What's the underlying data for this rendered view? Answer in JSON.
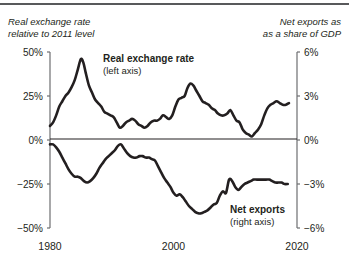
{
  "figure": {
    "header_left": "Real exchange rate\nrelative to 2011 level",
    "header_right": "Net exports as\nas a share of GDP",
    "label_upper_title": "Real exchange rate",
    "label_upper_sub": "(left axis)",
    "label_lower_title": "Net exports",
    "label_lower_sub": "(right axis)",
    "line_color": "#231f20",
    "axis_color": "#6d6e71",
    "background": "#ffffff"
  },
  "chart_data": {
    "type": "line",
    "title": "",
    "subtitle": "",
    "xlabel": "",
    "ylabel": "Real exchange rate relative to 2011 level",
    "y2label": "Net exports as as a share of GDP",
    "grid": false,
    "legend": "inline-annotations",
    "xlim": [
      1980,
      2020
    ],
    "xticks": [
      1980,
      2000,
      2020
    ],
    "xticklabels": [
      "1980",
      "2000",
      "2020"
    ],
    "ylim": [
      -50,
      50
    ],
    "yticks": [
      50,
      25,
      0,
      -25,
      -50
    ],
    "yticklabels": [
      "50%",
      "25%",
      "0%",
      "-25%",
      "-50%"
    ],
    "y2lim": [
      -6,
      6
    ],
    "y2ticks": [
      6,
      3,
      0,
      -3,
      -6
    ],
    "y2ticklabels": [
      "6%",
      "3%",
      "0%",
      "-3%",
      "-6%"
    ],
    "series": [
      {
        "name": "Real exchange rate",
        "axis": "left",
        "unit": "percent",
        "x": [
          1980,
          1980.5,
          1981,
          1981.5,
          1982,
          1982.5,
          1983,
          1983.5,
          1984,
          1984.5,
          1985,
          1985.4,
          1985.8,
          1986.3,
          1986.8,
          1987.3,
          1987.8,
          1988.3,
          1988.8,
          1989.3,
          1989.8,
          1990.3,
          1990.8,
          1991.3,
          1991.8,
          1992.3,
          1992.8,
          1993.3,
          1993.8,
          1994.3,
          1994.8,
          1995.3,
          1995.8,
          1996.3,
          1996.8,
          1997.3,
          1997.8,
          1998.3,
          1998.8,
          1999.3,
          1999.8,
          2000.3,
          2000.8,
          2001.3,
          2001.8,
          2002.2,
          2002.7,
          2003.2,
          2003.7,
          2004.2,
          2004.7,
          2005.2,
          2005.7,
          2006.2,
          2006.7,
          2007.2,
          2007.7,
          2008.2,
          2008.7,
          2009.2,
          2009.7,
          2010.2,
          2010.7,
          2011.2,
          2011.7,
          2012.2,
          2012.7,
          2013.2,
          2013.7,
          2014.2,
          2014.7,
          2015.2,
          2015.7,
          2016.2,
          2016.7,
          2017.2,
          2017.7,
          2018.2,
          2018.7
        ],
        "y": [
          8,
          10,
          14,
          19,
          22,
          25,
          27,
          30,
          34,
          40,
          46,
          44,
          38,
          31,
          27,
          23,
          21,
          19,
          16,
          15,
          14,
          13,
          10,
          7,
          8,
          10,
          11,
          12,
          11,
          9,
          8,
          7,
          8,
          10,
          11,
          11,
          12,
          14,
          13,
          12,
          14,
          19,
          23,
          24,
          25,
          29,
          32,
          31,
          28,
          25,
          22,
          21,
          20,
          18,
          17,
          15,
          14,
          14,
          15,
          17,
          14,
          11,
          10,
          6,
          4,
          3,
          2,
          4,
          6,
          9,
          14,
          18,
          20,
          21,
          22,
          21,
          20,
          20,
          21
        ],
        "labeled_points": {
          "1980_start": 8,
          "peak_1985": 46,
          "trough_1991": 7,
          "trough_1995": 7,
          "peak_2002": 32,
          "trough_2011": 1,
          "end_2018": 21
        }
      },
      {
        "name": "Net exports",
        "axis": "right",
        "unit": "percent_of_gdp",
        "x": [
          1980,
          1980.5,
          1981,
          1981.5,
          1982,
          1982.5,
          1983,
          1983.5,
          1984,
          1984.5,
          1985,
          1985.5,
          1986,
          1986.5,
          1987,
          1987.5,
          1988,
          1988.5,
          1989,
          1989.5,
          1990,
          1990.5,
          1991,
          1991.5,
          1992,
          1992.5,
          1993,
          1993.5,
          1994,
          1994.5,
          1995,
          1995.5,
          1996,
          1996.5,
          1997,
          1997.5,
          1998,
          1998.5,
          1999,
          1999.5,
          2000,
          2000.5,
          2001,
          2001.5,
          2002,
          2002.5,
          2003,
          2003.5,
          2004,
          2004.5,
          2005,
          2005.5,
          2006,
          2006.5,
          2007,
          2007.5,
          2008,
          2008.5,
          2009,
          2009.5,
          2010,
          2010.5,
          2011,
          2011.5,
          2012,
          2012.5,
          2013,
          2013.5,
          2014,
          2014.5,
          2015,
          2015.5,
          2016,
          2016.5,
          2017,
          2017.5,
          2018,
          2018.5
        ],
        "y": [
          -0.3,
          -0.3,
          -0.5,
          -0.8,
          -1.2,
          -1.6,
          -2.0,
          -2.3,
          -2.5,
          -2.5,
          -2.6,
          -2.8,
          -2.9,
          -2.8,
          -2.6,
          -2.3,
          -1.9,
          -1.6,
          -1.3,
          -1.1,
          -0.9,
          -0.7,
          -0.4,
          -0.3,
          -0.6,
          -0.9,
          -1.1,
          -1.2,
          -1.2,
          -1.1,
          -1.1,
          -1.2,
          -1.2,
          -1.3,
          -1.4,
          -1.8,
          -2.2,
          -2.6,
          -2.9,
          -3.2,
          -3.6,
          -3.8,
          -3.7,
          -3.9,
          -4.2,
          -4.5,
          -4.7,
          -4.9,
          -5.0,
          -5.0,
          -4.9,
          -4.8,
          -4.6,
          -4.4,
          -4.3,
          -3.8,
          -3.5,
          -3.6,
          -2.7,
          -2.8,
          -3.2,
          -3.4,
          -3.2,
          -3.0,
          -2.9,
          -2.8,
          -2.7,
          -2.7,
          -2.7,
          -2.7,
          -2.7,
          -2.7,
          -2.8,
          -2.9,
          -2.9,
          -2.9,
          -3.0,
          -3.0
        ],
        "labeled_points": {
          "1980_start": -0.3,
          "trough_1986": -2.9,
          "peak_1991": -0.3,
          "trough_2004": -5.0,
          "recovery_2009": -2.7,
          "end_2018": -3.0
        }
      }
    ]
  }
}
